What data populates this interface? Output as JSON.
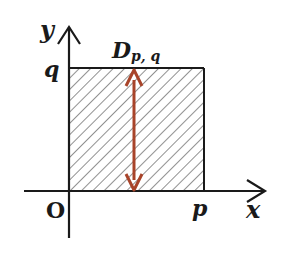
{
  "diagram": {
    "axes": {
      "x_label": "x",
      "y_label": "y",
      "origin_label": "O"
    },
    "ticks": {
      "x_tick_label": "p",
      "y_tick_label": "q"
    },
    "region": {
      "label_main": "D",
      "label_sub": "p, q",
      "fill": "hatched",
      "hatch_color": "#555555",
      "border_color": "#1a1a1a"
    },
    "arrow": {
      "type": "double-headed vertical",
      "color": "#a8442a"
    }
  }
}
